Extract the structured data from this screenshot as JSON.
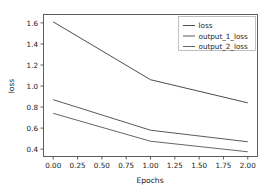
{
  "chart_data": {
    "type": "line",
    "title": "",
    "xlabel": "Epochs",
    "ylabel": "loss",
    "x": [
      0,
      1,
      2
    ],
    "xlim": [
      -0.1,
      2.1
    ],
    "ylim": [
      0.33,
      1.68
    ],
    "xticks": [
      0.0,
      0.25,
      0.5,
      0.75,
      1.0,
      1.25,
      1.5,
      1.75,
      2.0
    ],
    "xtick_labels": [
      "0.00",
      "0.25",
      "0.50",
      "0.75",
      "1.00",
      "1.25",
      "1.50",
      "1.75",
      "2.00"
    ],
    "yticks": [
      0.4,
      0.6,
      0.8,
      1.0,
      1.2,
      1.4,
      1.6
    ],
    "ytick_labels": [
      "0.4",
      "0.6",
      "0.8",
      "1.0",
      "1.2",
      "1.4",
      "1.6"
    ],
    "grid": false,
    "legend_position": "upper right",
    "series": [
      {
        "name": "loss",
        "values": [
          1.61,
          1.06,
          0.84
        ],
        "color": "#4d4d4d"
      },
      {
        "name": "output_1_loss",
        "values": [
          0.87,
          0.58,
          0.47
        ],
        "color": "#595959"
      },
      {
        "name": "output_2_loss",
        "values": [
          0.74,
          0.475,
          0.375
        ],
        "color": "#666666"
      }
    ]
  },
  "legend": {
    "entries": [
      {
        "label": "loss"
      },
      {
        "label": "output_1_loss"
      },
      {
        "label": "output_2_loss"
      }
    ]
  },
  "axes": {
    "x_title": "Epochs",
    "y_title": "loss"
  }
}
